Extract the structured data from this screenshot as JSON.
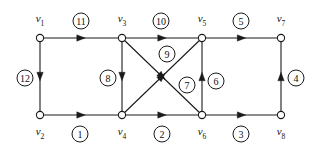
{
  "diagram": {
    "stroke_color": "#1a1a1a",
    "node_fill": "#ffffff",
    "background": "#ffffff",
    "nodes": [
      {
        "id": "v1",
        "label": "v",
        "sub": "1",
        "x": 40,
        "y": 38,
        "lx": 40,
        "ly": 20
      },
      {
        "id": "v3",
        "label": "v",
        "sub": "3",
        "x": 122,
        "y": 38,
        "lx": 122,
        "ly": 20
      },
      {
        "id": "v5",
        "label": "v",
        "sub": "5",
        "x": 202,
        "y": 38,
        "lx": 202,
        "ly": 20
      },
      {
        "id": "v7",
        "label": "v",
        "sub": "7",
        "x": 281,
        "y": 38,
        "lx": 281,
        "ly": 20
      },
      {
        "id": "v2",
        "label": "v",
        "sub": "2",
        "x": 40,
        "y": 115,
        "lx": 40,
        "ly": 133
      },
      {
        "id": "v4",
        "label": "v",
        "sub": "4",
        "x": 122,
        "y": 115,
        "lx": 122,
        "ly": 133
      },
      {
        "id": "v6",
        "label": "v",
        "sub": "6",
        "x": 202,
        "y": 115,
        "lx": 202,
        "ly": 133
      },
      {
        "id": "v8",
        "label": "v",
        "sub": "8",
        "x": 281,
        "y": 115,
        "lx": 281,
        "ly": 133
      }
    ],
    "edges": [
      {
        "id": "e1",
        "label": "1",
        "from": "v2",
        "to": "v4",
        "lx": 80,
        "ly": 134
      },
      {
        "id": "e2",
        "label": "2",
        "from": "v4",
        "to": "v6",
        "lx": 162,
        "ly": 134
      },
      {
        "id": "e3",
        "label": "3",
        "from": "v6",
        "to": "v8",
        "lx": 241,
        "ly": 134
      },
      {
        "id": "e4",
        "label": "4",
        "from": "v8",
        "to": "v7",
        "lx": 296,
        "ly": 78
      },
      {
        "id": "e5",
        "label": "5",
        "from": "v5",
        "to": "v7",
        "lx": 241,
        "ly": 21
      },
      {
        "id": "e6",
        "label": "6",
        "from": "v6",
        "to": "v5",
        "lx": 216,
        "ly": 81
      },
      {
        "id": "e7",
        "label": "7",
        "from": "v3",
        "to": "v6",
        "lx": 187,
        "ly": 85
      },
      {
        "id": "e8",
        "label": "8",
        "from": "v3",
        "to": "v4",
        "lx": 108,
        "ly": 78
      },
      {
        "id": "e9",
        "label": "9",
        "from": "v4",
        "to": "v5",
        "lx": 167,
        "ly": 54
      },
      {
        "id": "e10",
        "label": "10",
        "from": "v3",
        "to": "v5",
        "lx": 161,
        "ly": 21
      },
      {
        "id": "e11",
        "label": "11",
        "from": "v1",
        "to": "v3",
        "lx": 81,
        "ly": 21
      },
      {
        "id": "e12",
        "label": "12",
        "from": "v1",
        "to": "v2",
        "lx": 25,
        "ly": 78
      }
    ]
  }
}
